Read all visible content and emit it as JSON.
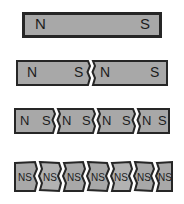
{
  "diagram": {
    "background_color": "#ffffff",
    "magnet_fill_color": "#a8a8a8",
    "magnet_fill_color_light": "#b2b2b2",
    "magnet_border_color": "#262626",
    "label_color": "#1c1c1c",
    "pole_north": "N",
    "pole_south": "S",
    "pole_pair": "NS",
    "rows": [
      {
        "row_id": "row-1",
        "segment_count": 1,
        "border_width": 3,
        "y": 12,
        "height": 26,
        "x": 22,
        "width": 140,
        "segments": [
          {
            "north": "N",
            "south": "S"
          }
        ]
      },
      {
        "row_id": "row-2",
        "segment_count": 2,
        "border_width": 2,
        "y": 60,
        "height": 25,
        "x": 16,
        "width": 152,
        "segments": [
          {
            "north": "N",
            "south": "S"
          },
          {
            "north": "N",
            "south": "S"
          }
        ]
      },
      {
        "row_id": "row-3",
        "segment_count": 4,
        "border_width": 2,
        "y": 108,
        "height": 25,
        "x": 14,
        "width": 156,
        "segments": [
          {
            "north": "N",
            "south": "S"
          },
          {
            "north": "N",
            "south": "S"
          },
          {
            "north": "N",
            "south": "S"
          },
          {
            "north": "N",
            "south": "S"
          }
        ]
      },
      {
        "row_id": "row-4",
        "segment_count": 8,
        "border_width": 2,
        "y": 162,
        "height": 30,
        "x": 14,
        "width": 158,
        "segments": [
          {
            "label": "NS"
          },
          {
            "label": "NS"
          },
          {
            "label": "NS"
          },
          {
            "label": "NS"
          },
          {
            "label": "NS"
          },
          {
            "label": "NS"
          },
          {
            "label": "NS"
          },
          {
            "label": "NS"
          }
        ]
      }
    ]
  }
}
